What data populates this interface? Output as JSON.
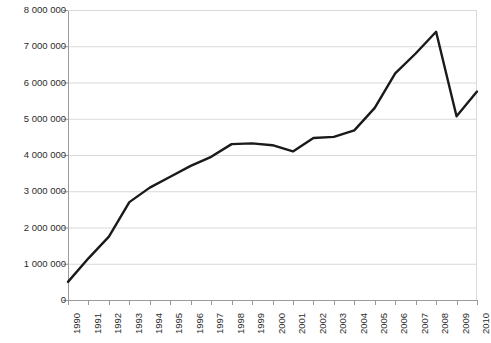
{
  "chart_data": {
    "type": "line",
    "title": "",
    "subtitle": "",
    "xlabel": "",
    "ylabel": "",
    "categories": [
      "1990",
      "1991",
      "1992",
      "1993",
      "1994",
      "1995",
      "1996",
      "1997",
      "1998",
      "1999",
      "2000",
      "2001",
      "2002",
      "2003",
      "2004",
      "2005",
      "2006",
      "2007",
      "2008",
      "2009",
      "2010"
    ],
    "values": [
      500000,
      1150000,
      1750000,
      2700000,
      3100000,
      3400000,
      3700000,
      3950000,
      4300000,
      4320000,
      4270000,
      4100000,
      4470000,
      4500000,
      4680000,
      5300000,
      6250000,
      6800000,
      7400000,
      5070000,
      5750000
    ],
    "series": [
      {
        "name": "",
        "values": [
          500000,
          1150000,
          1750000,
          2700000,
          3100000,
          3400000,
          3700000,
          3950000,
          4300000,
          4320000,
          4270000,
          4100000,
          4470000,
          4500000,
          4680000,
          5300000,
          6250000,
          6800000,
          7400000,
          5070000,
          5750000
        ]
      }
    ],
    "ylim": [
      0,
      8000000
    ],
    "ytick_values": [
      0,
      1000000,
      2000000,
      3000000,
      4000000,
      5000000,
      6000000,
      7000000,
      8000000
    ],
    "ytick_labels": [
      "0",
      "1 000 000",
      "2 000 000",
      "3 000 000",
      "4 000 000",
      "5 000 000",
      "6 000 000",
      "7 000 000",
      "8 000 000"
    ],
    "grid": true,
    "grid_axis": "y",
    "legend": false,
    "legend_position": "none",
    "annotations": [],
    "colors": {
      "line": "#1a1a1a",
      "grid": "#d9d9d9",
      "axis": "#9a9a9a",
      "text": "#2b2b2b",
      "background": "#ffffff"
    },
    "line_width": 2.4
  }
}
